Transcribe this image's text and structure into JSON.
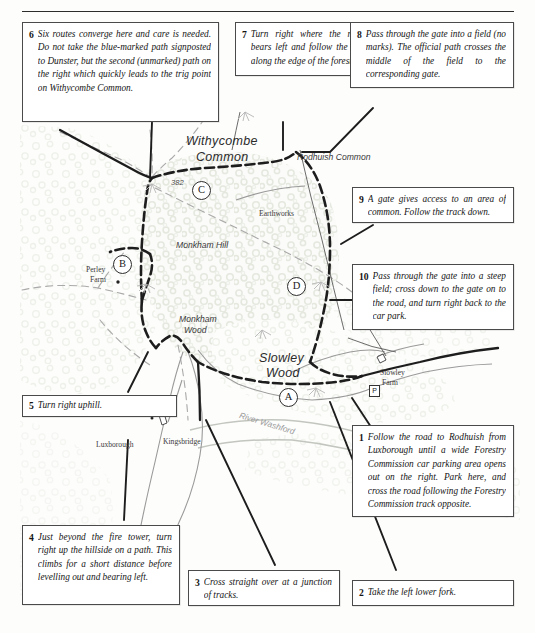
{
  "document": {
    "type": "walking-route-map",
    "title": "Withycombe Common / Monkham Hill walking route"
  },
  "notes": [
    {
      "id": "note-6",
      "number": "6",
      "text": "Six routes converge here and care is needed. Do not take the blue-marked path signposted to Dunster, but the second (unmarked) path on the right which quickly leads to the trig point on Withycombe Common."
    },
    {
      "id": "note-7",
      "number": "7",
      "text": "Turn right where the main track bears left and follow the track back along the edge of the forest."
    },
    {
      "id": "note-8",
      "number": "8",
      "text": "Pass through the gate into a field (no marks). The official path crosses the middle of the field to the corresponding gate."
    },
    {
      "id": "note-9",
      "number": "9",
      "text": "A gate gives access to an area of common. Follow the track down."
    },
    {
      "id": "note-10",
      "number": "10",
      "text": "Pass through the gate into a steep field; cross down to the gate on to the road, and turn right back to the car park."
    },
    {
      "id": "note-1",
      "number": "1",
      "text": "Follow the road to Rodhuish from Luxborough until a wide Forestry Commission car parking area opens out on the right. Park here, and cross the road following the Forestry Commission track opposite."
    },
    {
      "id": "note-2",
      "number": "2",
      "text": "Take the left lower fork."
    },
    {
      "id": "note-3",
      "number": "3",
      "text": "Cross straight over at a junction of tracks."
    },
    {
      "id": "note-4",
      "number": "4",
      "text": "Just beyond the fire tower, turn right up the hillside on a path. This climbs for a short distance before levelling out and bearing left."
    },
    {
      "id": "note-5",
      "number": "5",
      "text": "Turn right uphill."
    }
  ],
  "map": {
    "labels": {
      "withycombe_common_line1": "Withycombe",
      "withycombe_common_line2": "Common",
      "rodhuish_common": "Rodhuish Common",
      "earthworks": "Earthworks",
      "monkham_hill": "Monkham Hill",
      "perley_farm_line1": "Perley",
      "perley_farm_line2": "Farm",
      "monkham_wood_line1": "Monkham",
      "monkham_wood_line2": "Wood",
      "slowley_wood_line1": "Slowley",
      "slowley_wood_line2": "Wood",
      "slowley_farm_line1": "Slowley",
      "slowley_farm_line2": "Farm",
      "luxborough": "Luxborough",
      "kingsbridge": "Kingsbridge",
      "river_washford": "River Washford",
      "spot_height": "382",
      "parking_symbol": "P"
    },
    "waypoints": [
      {
        "id": "waypoint-a",
        "label": "A"
      },
      {
        "id": "waypoint-b",
        "label": "B"
      },
      {
        "id": "waypoint-c",
        "label": "C"
      },
      {
        "id": "waypoint-d",
        "label": "D"
      }
    ],
    "colors": {
      "route_track": "#1d1d1d",
      "minor_path": "#8f8f8f",
      "woodland_fill": "#eef0ea",
      "river": "#b9bdb6",
      "box_border": "#4a4a4a",
      "page_background": "#fdfdfc"
    }
  }
}
